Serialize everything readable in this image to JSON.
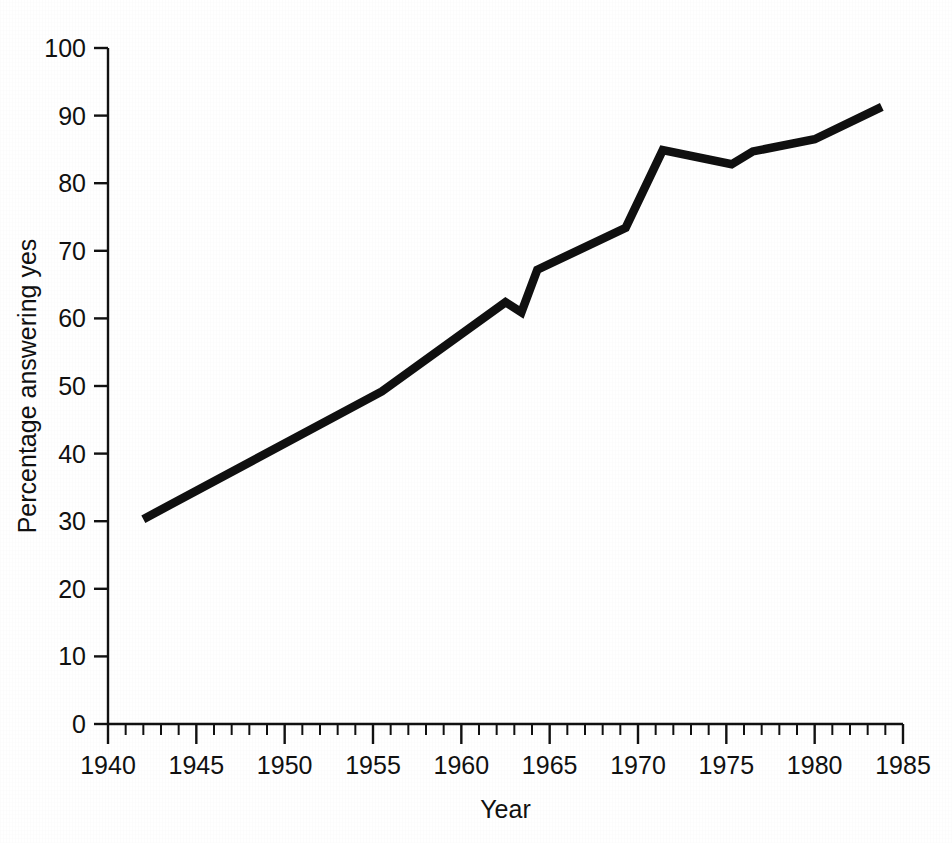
{
  "figure": {
    "background_color": "#ffffff",
    "ink_color": "#101010",
    "truncated_caption_top": "",
    "width": 952,
    "height": 843
  },
  "chart_data": {
    "type": "line",
    "title": "",
    "xlabel": "Year",
    "ylabel": "Percentage answering yes",
    "xlim": [
      1940,
      1985
    ],
    "ylim": [
      0,
      100
    ],
    "grid": false,
    "legend": null,
    "x_ticks": [
      1940,
      1945,
      1950,
      1955,
      1960,
      1965,
      1970,
      1975,
      1980,
      1985
    ],
    "x_tick_labels": [
      "1940",
      "1945",
      "1950",
      "1955",
      "1960",
      "1965",
      "1970",
      "1975",
      "1980",
      "1985"
    ],
    "x_minor_tick_step": 1,
    "y_ticks": [
      0,
      10,
      20,
      30,
      40,
      50,
      60,
      70,
      80,
      90,
      100
    ],
    "y_tick_labels": [
      "0",
      "10",
      "20",
      "30",
      "40",
      "50",
      "60",
      "70",
      "80",
      "90",
      "100"
    ],
    "series": [
      {
        "name": "Percentage answering yes",
        "color": "#101010",
        "line_width": 8.5,
        "x": [
          1942.0,
          1955.5,
          1962.5,
          1963.4,
          1964.3,
          1969.3,
          1971.4,
          1975.3,
          1976.5,
          1980.0,
          1983.8
        ],
        "values": [
          30.3,
          49.2,
          62.4,
          60.9,
          67.2,
          73.4,
          84.9,
          82.8,
          84.7,
          86.5,
          91.3
        ],
        "points": [
          {
            "year": 1942.0,
            "value": 30.3
          },
          {
            "year": 1955.5,
            "value": 49.2
          },
          {
            "year": 1962.5,
            "value": 62.4
          },
          {
            "year": 1963.4,
            "value": 60.9
          },
          {
            "year": 1964.3,
            "value": 67.2
          },
          {
            "year": 1969.3,
            "value": 73.4
          },
          {
            "year": 1971.4,
            "value": 84.9
          },
          {
            "year": 1975.3,
            "value": 82.8
          },
          {
            "year": 1976.5,
            "value": 84.7
          },
          {
            "year": 1980.0,
            "value": 86.5
          },
          {
            "year": 1983.8,
            "value": 91.3
          }
        ]
      }
    ]
  }
}
